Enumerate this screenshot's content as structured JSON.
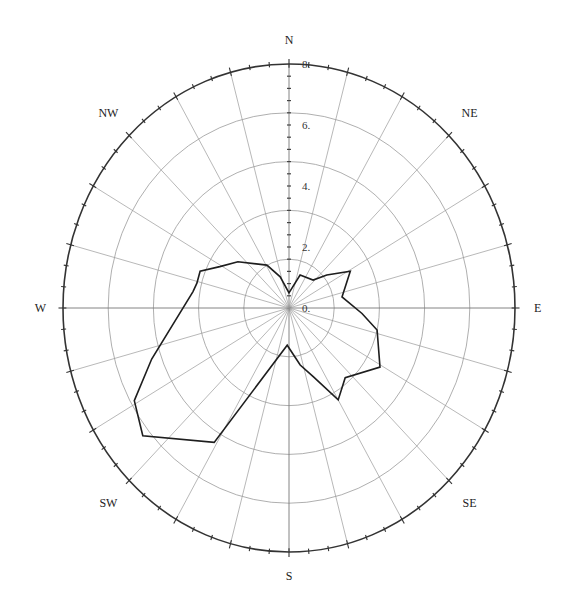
{
  "chart_data": {
    "type": "polar-line",
    "subtype": "wind-rose",
    "title": "",
    "rlabel": "",
    "r_ticks": [
      0,
      2,
      4,
      6,
      8
    ],
    "r_tick_labels": [
      "0.",
      "2.",
      "4.",
      "6.",
      "8."
    ],
    "rlim": [
      0,
      8
    ],
    "rings": [
      1.6,
      3.2,
      4.8,
      6.4,
      8.0
    ],
    "spoke_step_deg": 15,
    "outer_minor_tick_step_deg": 5,
    "direction_labels": [
      {
        "label": "N",
        "angle": 0
      },
      {
        "label": "NE",
        "angle": 45
      },
      {
        "label": "E",
        "angle": 90
      },
      {
        "label": "SE",
        "angle": 135
      },
      {
        "label": "S",
        "angle": 180
      },
      {
        "label": "SW",
        "angle": 225
      },
      {
        "label": "W",
        "angle": 270
      },
      {
        "label": "NW",
        "angle": 315
      }
    ],
    "grid": true,
    "legend": null,
    "series": [
      {
        "name": "frequency",
        "closed": true,
        "points": [
          {
            "angle": 0,
            "r": 0.5
          },
          {
            "angle": 20,
            "r": 1.15
          },
          {
            "angle": 43,
            "r": 1.25
          },
          {
            "angle": 51,
            "r": 1.72
          },
          {
            "angle": 61,
            "r": 2.48
          },
          {
            "angle": 79,
            "r": 1.91
          },
          {
            "angle": 94,
            "r": 2.59
          },
          {
            "angle": 103,
            "r": 3.2
          },
          {
            "angle": 121,
            "r": 3.76
          },
          {
            "angle": 139,
            "r": 3.03
          },
          {
            "angle": 150,
            "r": 3.48
          },
          {
            "angle": 159,
            "r": 2.42
          },
          {
            "angle": 168,
            "r": 1.91
          },
          {
            "angle": 183,
            "r": 1.22
          },
          {
            "angle": 211,
            "r": 5.14
          },
          {
            "angle": 231,
            "r": 6.66
          },
          {
            "angle": 241,
            "r": 6.26
          },
          {
            "angle": 251,
            "r": 5.14
          },
          {
            "angle": 279,
            "r": 3.44
          },
          {
            "angle": 284,
            "r": 3.36
          },
          {
            "angle": 291,
            "r": 3.37
          },
          {
            "angle": 299,
            "r": 2.8
          },
          {
            "angle": 310,
            "r": 2.36
          },
          {
            "angle": 331,
            "r": 1.61
          },
          {
            "angle": 343,
            "r": 1.07
          }
        ]
      }
    ]
  },
  "colors": {
    "background": "#ffffff",
    "outer_circle": "#333333",
    "grid": "#9a9a9a",
    "series_line": "#1e1e1e",
    "labels": "#222222"
  }
}
